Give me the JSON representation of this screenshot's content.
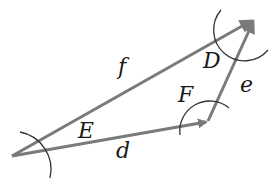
{
  "diagram": {
    "type": "vector-triangle",
    "colors": {
      "vector": "#7a7a7a",
      "arc": "#333333",
      "label": "#1a1a1a",
      "background": "#ffffff"
    },
    "vertices": {
      "left": {
        "x": 12,
        "y": 156
      },
      "right": {
        "x": 208,
        "y": 121
      },
      "top": {
        "x": 255,
        "y": 18
      }
    },
    "vectors": [
      {
        "name": "d",
        "from": "left",
        "to": "right",
        "label": "d"
      },
      {
        "name": "e",
        "from": "right",
        "to": "top",
        "label": "e"
      },
      {
        "name": "f",
        "from": "left",
        "to": "top",
        "label": "f"
      }
    ],
    "angles": [
      {
        "name": "E",
        "vertex": "left",
        "label": "E"
      },
      {
        "name": "F",
        "vertex": "right",
        "label": "F"
      },
      {
        "name": "D",
        "vertex": "top",
        "label": "D"
      }
    ]
  }
}
